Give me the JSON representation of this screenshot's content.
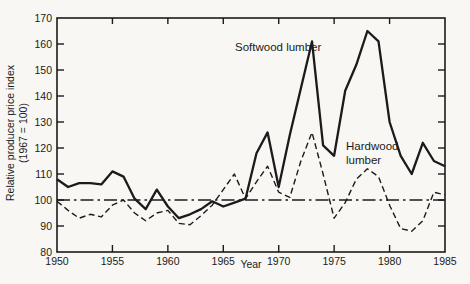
{
  "figure": {
    "background": "#f8f7f3",
    "line_color": "#1b1b1b"
  },
  "chart_data": {
    "type": "line",
    "title": "",
    "xlabel": "Year",
    "ylabel_line1": "Relative producer price index",
    "ylabel_line2": "(1967 = 100)",
    "xlim": [
      1950,
      1985
    ],
    "ylim": [
      80,
      170
    ],
    "x_ticks": [
      1950,
      1955,
      1960,
      1965,
      1970,
      1975,
      1980,
      1985
    ],
    "y_ticks": [
      80,
      90,
      100,
      110,
      120,
      130,
      140,
      150,
      160,
      170
    ],
    "grid": false,
    "frame": "box",
    "tick_sides": [
      "left",
      "bottom",
      "right",
      "top"
    ],
    "legend_position": "inline-annotations",
    "reference_line": {
      "y": 100,
      "style": "dash-dot"
    },
    "years": [
      1950,
      1951,
      1952,
      1953,
      1954,
      1955,
      1956,
      1957,
      1958,
      1959,
      1960,
      1961,
      1962,
      1963,
      1964,
      1965,
      1966,
      1967,
      1968,
      1969,
      1970,
      1971,
      1972,
      1973,
      1974,
      1975,
      1976,
      1977,
      1978,
      1979,
      1980,
      1981,
      1982,
      1983,
      1984,
      1985
    ],
    "series": [
      {
        "name": "Softwood lumber",
        "style": "solid",
        "values": [
          108,
          105,
          106.5,
          106.5,
          106,
          111,
          109,
          100.5,
          96.5,
          104,
          97.5,
          93,
          94.5,
          96.5,
          99.5,
          97.5,
          99,
          100.5,
          118,
          126,
          105,
          125,
          143,
          161,
          121,
          117,
          142,
          152,
          165,
          161,
          130,
          117,
          110,
          122,
          115,
          113
        ]
      },
      {
        "name": "Hardwood lumber",
        "style": "dashed",
        "values": [
          99.5,
          96,
          93,
          94.5,
          93.5,
          98,
          100,
          95,
          92,
          95,
          96,
          91,
          90.5,
          94,
          98,
          104,
          110,
          100.5,
          107,
          113,
          103,
          101,
          115,
          126,
          110,
          93,
          99,
          108,
          112,
          109,
          98,
          89,
          88,
          92,
          103,
          102
        ]
      }
    ],
    "annotations": [
      {
        "text": "Softwood lumber",
        "series": "Softwood lumber",
        "x": 1966.1,
        "y": 157
      },
      {
        "text": "Hardwood lumber",
        "series": "Hardwood lumber",
        "x": 1976.1,
        "y": 122
      }
    ]
  }
}
